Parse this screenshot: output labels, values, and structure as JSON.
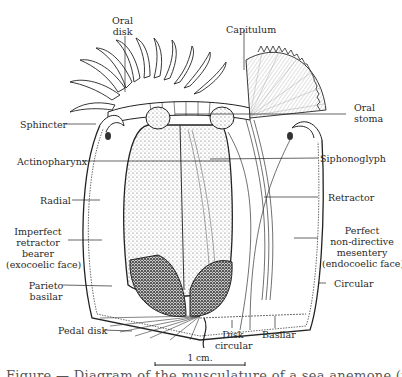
{
  "figure": {
    "type": "anatomical diagram",
    "labels": {
      "oral_disk": [
        "Oral",
        "disk"
      ],
      "capitulum": "Capitulum",
      "oral_stoma": [
        "Oral",
        "stoma"
      ],
      "sphincter": "Sphincter",
      "actinopharynx": "Actinopharynx",
      "siphonoglyph": "Siphonoglyph",
      "radial": "Radial",
      "retractor": "Retractor",
      "imperfect_retractor_bearer": [
        "Imperfect",
        "retractor",
        "bearer",
        "(exocoelic face)"
      ],
      "perfect_nondirective_mesentery": [
        "Perfect",
        "non-directive",
        "mesentery",
        "(endocoelic face)"
      ],
      "parieto_basilar": [
        "Parieto",
        "basilar"
      ],
      "circular": "Circular",
      "pedal_disk": "Pedal disk",
      "disk_circular": [
        "Disk",
        "circular"
      ],
      "basilar": "Basilar"
    },
    "scale_bar": {
      "label": "1 cm."
    },
    "caption_partial": "Figure — Diagram of the musculature of a sea anemone (truncated)"
  }
}
